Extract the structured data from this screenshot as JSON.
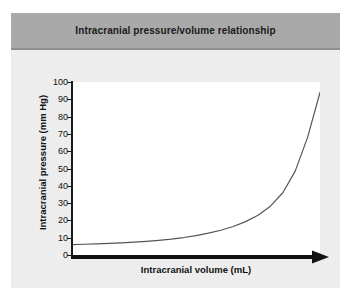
{
  "figure": {
    "title": "Intracranial pressure/volume relationship",
    "panel_color": "#ededed",
    "title_band_color": "#a9a9a9",
    "plot_background": "#ffffff"
  },
  "chart_data": {
    "type": "line",
    "title": "Intracranial pressure/volume relationship",
    "xlabel": "Intracranial volume (mL)",
    "ylabel": "Intracranial pressure (mm Hg)",
    "ylim": [
      0,
      100
    ],
    "xlim": [
      0,
      100
    ],
    "yticks": [
      0,
      10,
      20,
      30,
      40,
      50,
      60,
      70,
      80,
      90,
      100
    ],
    "ytick_labels": [
      "0",
      "10",
      "20",
      "30",
      "40",
      "50",
      "60",
      "70",
      "80",
      "90",
      "100"
    ],
    "xticks": [],
    "xtick_labels": [],
    "grid": false,
    "legend": null,
    "axis_style": {
      "x_axis": "thick-black-arrow-right",
      "y_axis": "thin-black-line-with-ticks"
    },
    "series": [
      {
        "name": "Pressure-volume curve",
        "color": "#555555",
        "line_width": 1.2,
        "x": [
          0,
          5,
          10,
          15,
          20,
          25,
          30,
          35,
          40,
          45,
          50,
          55,
          60,
          65,
          70,
          75,
          80,
          85,
          90,
          95,
          100
        ],
        "y": [
          6.0,
          6.2,
          6.4,
          6.7,
          7.0,
          7.4,
          7.9,
          8.5,
          9.2,
          10.1,
          11.2,
          12.6,
          14.3,
          16.5,
          19.3,
          23.0,
          28.2,
          36.0,
          48.5,
          68.0,
          94.0
        ]
      }
    ],
    "annotations": []
  }
}
